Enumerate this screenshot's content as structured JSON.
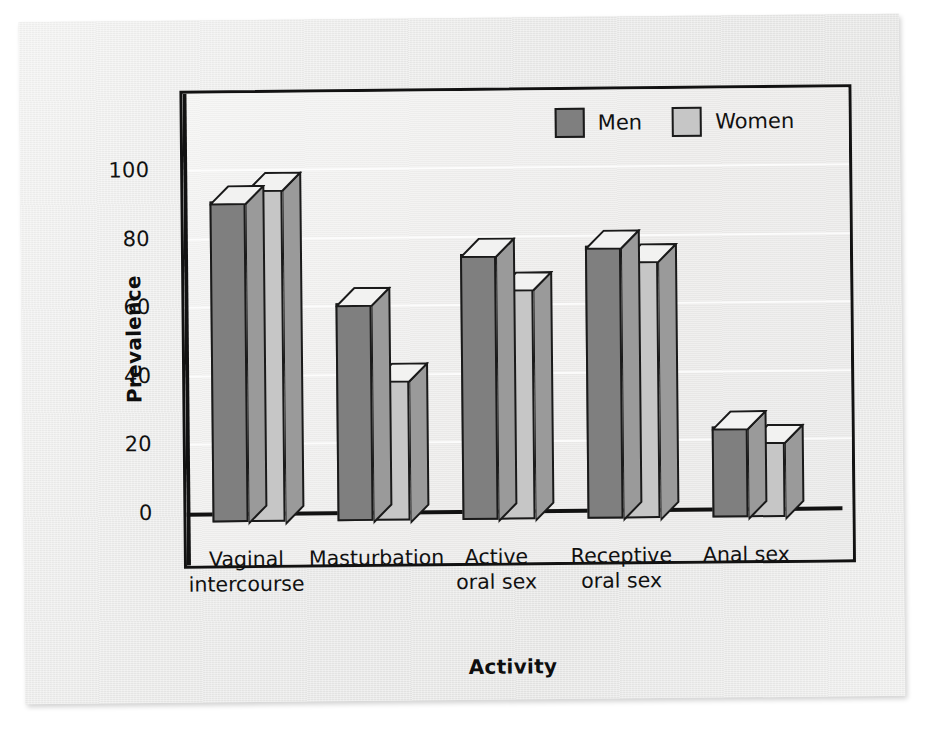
{
  "chart_data": {
    "type": "bar",
    "title": "",
    "xlabel": "Activity",
    "ylabel": "Prevalence",
    "categories": [
      "Vaginal\nintercourse",
      "Masturbation",
      "Active\noral sex",
      "Receptive\noral sex",
      "Anal sex"
    ],
    "series": [
      {
        "name": "Men",
        "color": "#7f7f7f",
        "values": [
          90,
          60,
          74,
          76,
          23
        ]
      },
      {
        "name": "Women",
        "color": "#c6c6c6",
        "values": [
          94,
          38,
          64,
          72,
          19
        ]
      }
    ],
    "ylim": [
      0,
      110
    ],
    "yticks": [
      0,
      20,
      40,
      60,
      80,
      100
    ],
    "ytick_labels": [
      "0",
      "20",
      "40",
      "60",
      "80",
      "100"
    ],
    "grid": true,
    "grid_axis": "y",
    "legend_position": "top-right-inside",
    "style": "3d-bar",
    "frame": true
  },
  "legend": {
    "items": [
      {
        "label": "Men",
        "swatch": "men"
      },
      {
        "label": "Women",
        "swatch": "women"
      }
    ]
  },
  "axes": {
    "y_title": "Prevalence",
    "x_title": "Activity"
  },
  "colors": {
    "men": "#7f7f7f",
    "women": "#c6c6c6",
    "axis": "#121212",
    "page": "#ececeb",
    "plot_background": "#eeeeed",
    "bar_outline": "#1a1a1a",
    "bar_top": "#f2f2f1",
    "bar_side": "#9a9a9a"
  }
}
